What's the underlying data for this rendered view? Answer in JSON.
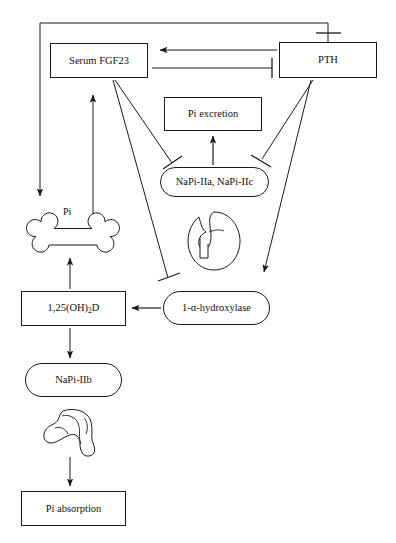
{
  "diagram": {
    "type": "flowchart",
    "stroke_color": "#1a1a1a",
    "background_color": "#ffffff",
    "nodes": [
      {
        "id": "serum_fgf23",
        "label": "Serum FGF23",
        "shape": "rect",
        "x": 50,
        "y": 43,
        "w": 98,
        "h": 35
      },
      {
        "id": "pth",
        "label": "PTH",
        "shape": "rect",
        "x": 279,
        "y": 42,
        "w": 98,
        "h": 36
      },
      {
        "id": "pi_excretion",
        "label": "Pi excretion",
        "shape": "rect",
        "x": 164,
        "y": 97,
        "w": 98,
        "h": 34
      },
      {
        "id": "napi_iia_iic",
        "label": "NaPi-IIa, NaPi-IIc",
        "shape": "rounded",
        "x": 160,
        "y": 167,
        "w": 109,
        "h": 30
      },
      {
        "id": "vitd",
        "label": "1,25(OH)2D",
        "shape": "rect",
        "x": 21,
        "y": 291,
        "w": 105,
        "h": 35
      },
      {
        "id": "hydroxylase",
        "label": "1-α-hydroxylase",
        "shape": "rounded",
        "x": 163,
        "y": 291,
        "w": 107,
        "h": 34
      },
      {
        "id": "napi_iib",
        "label": "NaPi-IIb",
        "shape": "rounded",
        "x": 25,
        "y": 363,
        "w": 97,
        "h": 34
      },
      {
        "id": "pi_absorption",
        "label": "Pi absorption",
        "shape": "rect",
        "x": 21,
        "y": 491,
        "w": 105,
        "h": 35
      }
    ],
    "organs": [
      {
        "id": "bone",
        "name": "bone-icon",
        "label": "Pi"
      },
      {
        "id": "kidney",
        "name": "kidney-icon",
        "label": ""
      },
      {
        "id": "intestine",
        "name": "intestine-icon",
        "label": ""
      }
    ],
    "free_labels": [
      {
        "id": "pi_bone_label",
        "text": "Pi",
        "x": 63,
        "y": 206
      }
    ],
    "edges": [
      {
        "from": "pth",
        "to": "bone",
        "kind": "arrow",
        "note": "PTH top, routed left and down to bone"
      },
      {
        "from": "pth",
        "to": "serum_fgf23",
        "kind": "arrow",
        "note": "horizontal arrow pointing left"
      },
      {
        "from": "serum_fgf23",
        "to": "pth",
        "kind": "inhibition",
        "note": "horizontal line with T-bar at PTH"
      },
      {
        "from": "bone",
        "to": "serum_fgf23",
        "kind": "arrow",
        "note": "upward arrow"
      },
      {
        "from": "serum_fgf23",
        "to": "napi_iia_iic",
        "kind": "inhibition"
      },
      {
        "from": "serum_fgf23",
        "to": "hydroxylase",
        "kind": "inhibition"
      },
      {
        "from": "pth",
        "to": "napi_iia_iic",
        "kind": "inhibition"
      },
      {
        "from": "pth",
        "to": "hydroxylase",
        "kind": "arrow"
      },
      {
        "from": "napi_iia_iic",
        "to": "pi_excretion",
        "kind": "arrow"
      },
      {
        "from": "hydroxylase",
        "to": "vitd",
        "kind": "arrow"
      },
      {
        "from": "vitd",
        "to": "bone",
        "kind": "arrow"
      },
      {
        "from": "vitd",
        "to": "napi_iib",
        "kind": "arrow"
      },
      {
        "from": "intestine",
        "to": "pi_absorption",
        "kind": "arrow"
      }
    ],
    "legend": {
      "arrow_meaning": "stimulation",
      "bar_meaning": "inhibition"
    }
  }
}
